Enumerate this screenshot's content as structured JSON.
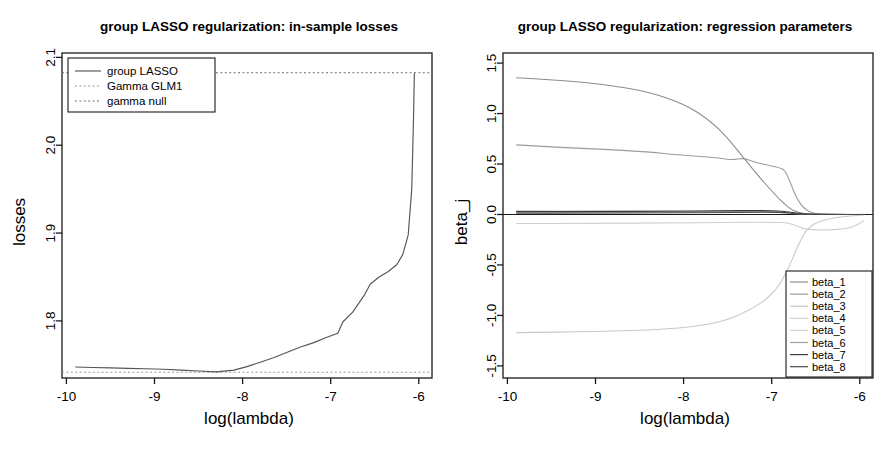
{
  "figure": {
    "panels": [
      {
        "id": "in-sample-losses",
        "title": "group LASSO regularization: in-sample losses",
        "xlabel": "log(lambda)",
        "ylabel": "losses"
      },
      {
        "id": "regression-parameters",
        "title": "group LASSO regularization: regression parameters",
        "xlabel": "log(lambda)",
        "ylabel": "beta_j"
      }
    ]
  },
  "chart_data": [
    {
      "type": "line",
      "id": "in-sample-losses",
      "title": "group LASSO regularization: in-sample losses",
      "xlabel": "log(lambda)",
      "ylabel": "losses",
      "xlim": [
        -10.05,
        -5.85
      ],
      "ylim": [
        1.735,
        2.105
      ],
      "xticks": [
        -10,
        -9,
        -8,
        -7,
        -6
      ],
      "xticklabels": [
        "-10",
        "-9",
        "-8",
        "-7",
        "-6"
      ],
      "yticks": [
        1.8,
        1.9,
        2.0,
        2.1
      ],
      "yticklabels": [
        "1.8",
        "1.9",
        "2.0",
        "2.1"
      ],
      "grid": false,
      "legend_position": "top-left",
      "legend": [
        "group LASSO",
        "Gamma GLM1",
        "gamma null"
      ],
      "series": [
        {
          "name": "group LASSO",
          "style": "solid",
          "color": "#555555",
          "x": [
            -9.9,
            -9.7,
            -9.5,
            -9.3,
            -9.1,
            -8.9,
            -8.7,
            -8.5,
            -8.3,
            -8.1,
            -7.95,
            -7.8,
            -7.65,
            -7.5,
            -7.35,
            -7.2,
            -7.05,
            -6.92,
            -6.86,
            -6.75,
            -6.62,
            -6.55,
            -6.45,
            -6.35,
            -6.25,
            -6.18,
            -6.12,
            -6.08,
            -6.06,
            -6.05
          ],
          "y": [
            1.7475,
            1.747,
            1.7465,
            1.746,
            1.7455,
            1.745,
            1.744,
            1.743,
            1.742,
            1.744,
            1.748,
            1.753,
            1.758,
            1.764,
            1.77,
            1.775,
            1.781,
            1.786,
            1.799,
            1.81,
            1.829,
            1.842,
            1.85,
            1.856,
            1.864,
            1.876,
            1.898,
            1.95,
            2.03,
            2.082
          ]
        },
        {
          "name": "Gamma GLM1",
          "style": "dotted",
          "color": "#9a9a9a",
          "value": 1.7415,
          "description": "horizontal dotted reference line near the bottom"
        },
        {
          "name": "gamma null",
          "style": "dotted",
          "color": "#6e6e6e",
          "value": 2.0825,
          "description": "horizontal dotted reference line near the top"
        }
      ]
    },
    {
      "type": "line",
      "id": "regression-parameters",
      "title": "group LASSO regularization: regression parameters",
      "xlabel": "log(lambda)",
      "ylabel": "beta_j",
      "xlim": [
        -10.05,
        -5.85
      ],
      "ylim": [
        -1.62,
        1.6
      ],
      "xticks": [
        -10,
        -9,
        -8,
        -7,
        -6
      ],
      "xticklabels": [
        "-10",
        "-9",
        "-8",
        "-7",
        "-6"
      ],
      "yticks": [
        -1.5,
        -1.0,
        -0.5,
        0.0,
        0.5,
        1.0,
        1.5
      ],
      "yticklabels": [
        "-1.5",
        "-1.0",
        "-0.5",
        "0.0",
        "0.5",
        "1.0",
        "1.5"
      ],
      "grid": false,
      "legend_position": "bottom-right",
      "legend": [
        "beta_1",
        "beta_2",
        "beta_3",
        "beta_4",
        "beta_5",
        "beta_6",
        "beta_7",
        "beta_8"
      ],
      "series": [
        {
          "name": "beta_1",
          "color": "#8c8c8c",
          "x": [
            -9.9,
            -9.4,
            -8.9,
            -8.4,
            -8.0,
            -7.7,
            -7.5,
            -7.3,
            -7.1,
            -6.95,
            -6.85,
            -6.78,
            -6.7,
            -6.6,
            -6.45,
            -6.2,
            -5.95
          ],
          "y": [
            1.355,
            1.33,
            1.29,
            1.215,
            1.1,
            0.93,
            0.76,
            0.54,
            0.33,
            0.185,
            0.1,
            0.05,
            0.02,
            0.005,
            0.0,
            0.0,
            0.0
          ]
        },
        {
          "name": "beta_2",
          "color": "#9c9c9c",
          "x": [
            -9.9,
            -9.4,
            -8.9,
            -8.4,
            -8.05,
            -7.8,
            -7.6,
            -7.45,
            -7.32,
            -7.2,
            -7.1,
            -7.0,
            -6.92,
            -6.85,
            -6.78,
            -6.72,
            -6.62,
            -6.5,
            -6.3,
            -6.0
          ],
          "y": [
            0.69,
            0.665,
            0.645,
            0.62,
            0.59,
            0.575,
            0.56,
            0.54,
            0.56,
            0.52,
            0.5,
            0.48,
            0.465,
            0.44,
            0.3,
            0.16,
            0.045,
            0.005,
            0.0,
            0.0
          ]
        },
        {
          "name": "beta_3",
          "color": "#c8c8c8",
          "x": [
            -9.9,
            -9.0,
            -8.2,
            -7.6,
            -7.2,
            -6.95,
            -6.8,
            -6.7,
            -6.6,
            -6.45,
            -6.2,
            -5.95
          ],
          "y": [
            -1.17,
            -1.16,
            -1.14,
            -1.08,
            -0.93,
            -0.76,
            -0.52,
            -0.3,
            -0.14,
            -0.06,
            -0.02,
            -0.005
          ]
        },
        {
          "name": "beta_4",
          "color": "#cfcfcf",
          "x": [
            -9.9,
            -9.0,
            -8.2,
            -7.5,
            -7.0,
            -6.8,
            -6.7,
            -6.6,
            -6.4,
            -6.1,
            -5.95
          ],
          "y": [
            -0.09,
            -0.088,
            -0.084,
            -0.08,
            -0.075,
            -0.085,
            -0.12,
            -0.15,
            -0.155,
            -0.14,
            -0.06
          ]
        },
        {
          "name": "beta_5",
          "color": "#d4d4d4",
          "x": [
            -9.9,
            -9.0,
            -8.2,
            -7.5,
            -7.1,
            -6.9,
            -6.75,
            -6.6,
            -6.3,
            -5.95
          ],
          "y": [
            0.038,
            0.036,
            0.034,
            0.03,
            0.025,
            0.018,
            0.01,
            0.004,
            0.002,
            0.001
          ]
        },
        {
          "name": "beta_6",
          "color": "#a0a0a0",
          "x": [
            -9.9,
            -9.0,
            -8.2,
            -7.5,
            -7.1,
            -6.9,
            -6.75,
            -6.6,
            -6.3,
            -5.95
          ],
          "y": [
            0.022,
            0.022,
            0.024,
            0.028,
            0.03,
            0.022,
            0.012,
            0.004,
            0.001,
            0.0
          ]
        },
        {
          "name": "beta_7",
          "color": "#3a3a3a",
          "x": [
            -9.9,
            -9.0,
            -8.2,
            -7.6,
            -7.2,
            -7.0,
            -6.85,
            -6.72,
            -6.6,
            -6.3,
            -5.95
          ],
          "y": [
            0.03,
            0.03,
            0.032,
            0.036,
            0.04,
            0.038,
            0.03,
            0.014,
            0.004,
            0.001,
            0.0
          ]
        },
        {
          "name": "beta_8",
          "color": "#4a4a4a",
          "x": [
            -9.9,
            -9.0,
            -8.2,
            -7.6,
            -7.2,
            -7.0,
            -6.85,
            -6.72,
            -6.6,
            -6.3,
            -5.95
          ],
          "y": [
            0.014,
            0.014,
            0.016,
            0.018,
            0.022,
            0.024,
            0.018,
            0.008,
            0.002,
            0.0,
            0.0
          ]
        }
      ],
      "zero_line": 0.0
    }
  ]
}
